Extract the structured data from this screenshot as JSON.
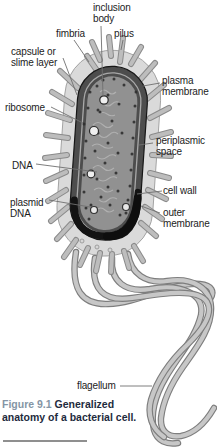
{
  "figure": {
    "labels": {
      "inclusion_body": {
        "line1": "inclusion",
        "line2": "body"
      },
      "fimbria": {
        "line1": "fimbria"
      },
      "pilus": {
        "line1": "pilus"
      },
      "capsule": {
        "line1": "capsule or",
        "line2": "slime layer"
      },
      "plasma_membrane": {
        "line1": "plasma",
        "line2": "membrane"
      },
      "ribosome": {
        "line1": "ribosome"
      },
      "periplasmic_space": {
        "line1": "periplasmic",
        "line2": "space"
      },
      "dna": {
        "line1": "DNA"
      },
      "cell_wall": {
        "line1": "cell wall"
      },
      "plasmid_dna": {
        "line1": "plasmid",
        "line2": "DNA"
      },
      "outer_membrane": {
        "line1": "outer",
        "line2": "membrane"
      },
      "flagellum": {
        "line1": "flagellum"
      }
    },
    "caption": {
      "number": "Figure 9.1",
      "text": "Generalized anatomy of a bacterial cell."
    },
    "colors": {
      "caption_number": "#8595a5",
      "caption_text": "#1e2b3d",
      "label_text": "#1c1c1c",
      "capsule_fill": "#dadada",
      "membrane_band": "#4d4d4d",
      "cytoplasm_fill": "#919191",
      "pilus_fill": "#bdbdbd",
      "flagellum_fill": "#c7c7c7"
    }
  }
}
